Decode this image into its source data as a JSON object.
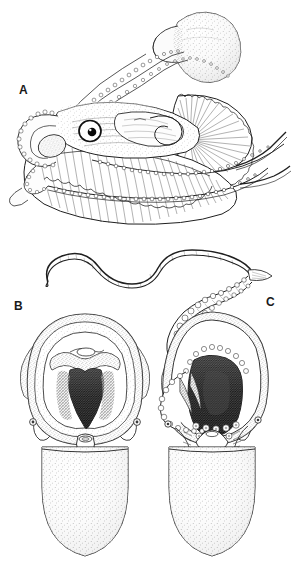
{
  "figure": {
    "background_color": "#ffffff",
    "ink_color": "#1f1f1f",
    "medium": "pen-and-ink stipple scientific illustration",
    "width_px": 294,
    "height_px": 578
  },
  "panels": [
    {
      "id": "A",
      "label": "A",
      "name": "panel-a-lateral-view",
      "description": "Lateral view of a finned cephalopod with large radiating fins, prominent eye, sucker-lined arms extended upward grasping a bulbous prey item, and two long trailing tentacles at right",
      "features": [
        "large-radiating-fin",
        "scalloped-fin-margin",
        "prominent-eye",
        "sucker-lined-arms",
        "bulbous-prey-mass",
        "trailing-tentacles"
      ]
    },
    {
      "id": "tentacle",
      "label": "",
      "name": "detached-tentacle-detail",
      "description": "Long whip-like tentacle coiled in an S-curve with an expanded sucker-bearing club at its distal right end",
      "features": [
        "whip-like-stalk",
        "sucker-bearing-club",
        "s-curve-coil"
      ]
    },
    {
      "id": "B",
      "label": "B",
      "name": "panel-b-frontal-view",
      "description": "Frontal/ventral view showing the open buccal mass and dark mouth opening framed by a thick web, arms splayed outward, and a smooth stippled ovoid mantle below",
      "features": [
        "open-buccal-mass",
        "dark-mouth-opening",
        "interbrachial-web",
        "splayed-arms",
        "funnel",
        "stippled-ovoid-mantle"
      ]
    },
    {
      "id": "C",
      "label": "C",
      "name": "panel-c-frontal-view-tentacle-extended",
      "description": "Frontal/ventral view with one sucker-lined tentacle extended up and to the left, dark open mouth cavity at the centre, sucker rows visible on the arms, and a stippled ovoid mantle below",
      "features": [
        "extended-sucker-tentacle",
        "dark-mouth-cavity",
        "sucker-rows",
        "arm-crown",
        "stippled-ovoid-mantle"
      ]
    }
  ],
  "labels": {
    "a": "A",
    "b": "B",
    "c": "C"
  }
}
